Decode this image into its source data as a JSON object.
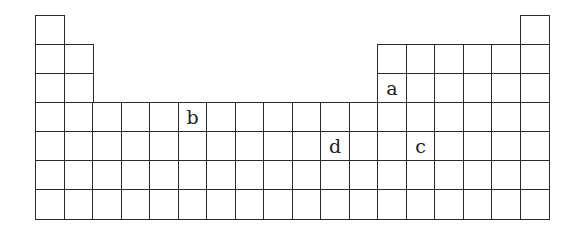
{
  "diagram": {
    "type": "periodic-table-outline",
    "columns": 18,
    "rows": 7,
    "layout": {
      "origin_x": 35,
      "origin_y": 15,
      "cell_width": 28.5,
      "cell_height": 29,
      "line_color": "#2a2a2a"
    },
    "row_spans": [
      {
        "row": 1,
        "columns": [
          1,
          18
        ]
      },
      {
        "row": 2,
        "columns": [
          1,
          2,
          13,
          14,
          15,
          16,
          17,
          18
        ]
      },
      {
        "row": 3,
        "columns": [
          1,
          2,
          13,
          14,
          15,
          16,
          17,
          18
        ]
      },
      {
        "row": 4,
        "columns": "1-18"
      },
      {
        "row": 5,
        "columns": "1-18"
      },
      {
        "row": 6,
        "columns": "1-18"
      },
      {
        "row": 7,
        "columns": "1-18"
      }
    ],
    "labels": [
      {
        "text": "a",
        "row": 3,
        "column": 13
      },
      {
        "text": "b",
        "row": 4,
        "column": 6
      },
      {
        "text": "d",
        "row": 5,
        "column": 11
      },
      {
        "text": "c",
        "row": 5,
        "column": 14
      }
    ]
  }
}
